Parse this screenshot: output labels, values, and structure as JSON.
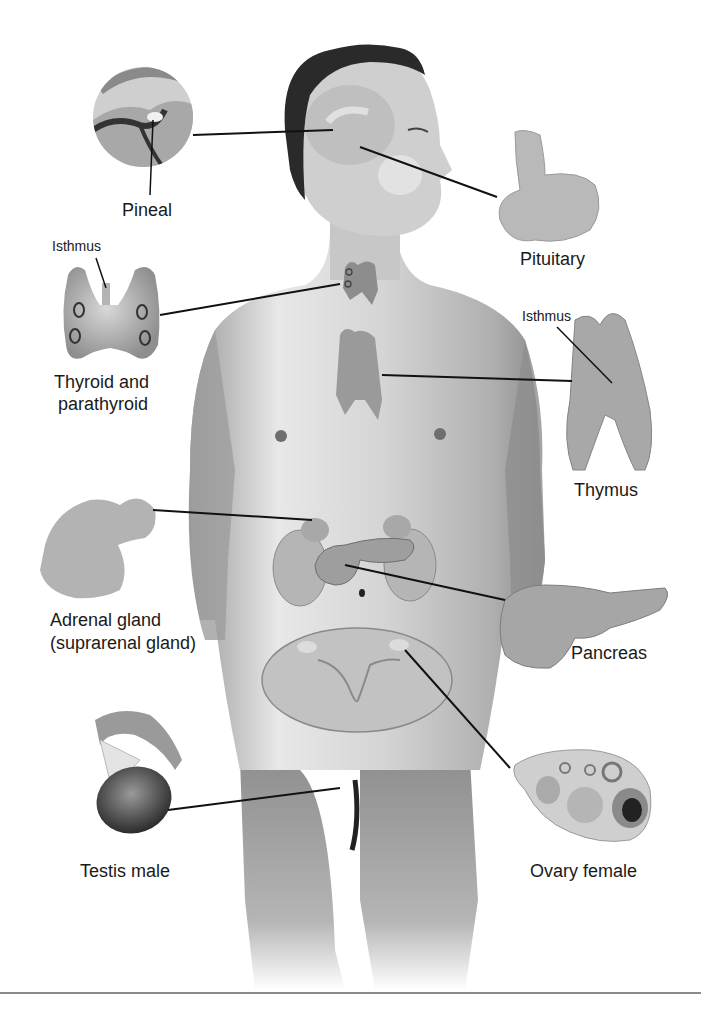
{
  "diagram": {
    "type": "anatomy",
    "labels": {
      "pineal": "Pineal",
      "pituitary": "Pituitary",
      "isthmus_thyroid": "Isthmus",
      "thyroid_line1": "Thyroid and",
      "thyroid_line2": "parathyroid",
      "isthmus_thymus": "Isthmus",
      "thymus": "Thymus",
      "adrenal_line1": "Adrenal gland",
      "adrenal_line2": "(suprarenal gland)",
      "pancreas": "Pancreas",
      "testis": "Testis male",
      "ovary": "Ovary female"
    },
    "colors": {
      "background": "#ffffff",
      "leader_line": "#111111",
      "skin_light": "#e6e6e6",
      "skin_mid": "#bdbdbd",
      "skin_dark": "#8c8c8c",
      "hair": "#2a2a2a",
      "rule": "#8a8a8a"
    }
  }
}
